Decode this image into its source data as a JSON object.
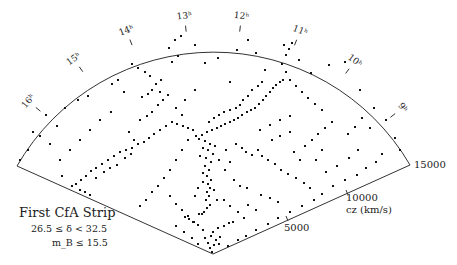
{
  "chart_data": {
    "type": "scatter",
    "projection": "polar wedge (redshift cone diagram)",
    "title": "First CfA Strip",
    "subtitle_lines": [
      "26.5 ≤ δ < 32.5",
      "m_B ≤ 15.5"
    ],
    "radial_axis": {
      "label": "cz (km/s)",
      "ticks": [
        5000,
        10000,
        15000
      ],
      "range": [
        0,
        15000
      ]
    },
    "angular_axis": {
      "label": "right ascension",
      "ticks": [
        "8h",
        "9h",
        "10h",
        "11h",
        "12h",
        "13h",
        "14h",
        "15h",
        "16h",
        "17h"
      ],
      "range_hours": [
        8,
        17
      ]
    },
    "grid": false,
    "legend": null,
    "points_px": [
      [
        212,
        252
      ],
      [
        210,
        248
      ],
      [
        214,
        245
      ],
      [
        208,
        243
      ],
      [
        216,
        240
      ],
      [
        205,
        238
      ],
      [
        220,
        237
      ],
      [
        211,
        236
      ],
      [
        213,
        232
      ],
      [
        203,
        230
      ],
      [
        218,
        228
      ],
      [
        224,
        226
      ],
      [
        229,
        223
      ],
      [
        233,
        222
      ],
      [
        198,
        225
      ],
      [
        193,
        222
      ],
      [
        189,
        219
      ],
      [
        185,
        217
      ],
      [
        199,
        214
      ],
      [
        204,
        212
      ],
      [
        207,
        208
      ],
      [
        210,
        205
      ],
      [
        206,
        200
      ],
      [
        209,
        196
      ],
      [
        207,
        192
      ],
      [
        210,
        188
      ],
      [
        208,
        184
      ],
      [
        211,
        180
      ],
      [
        207,
        176
      ],
      [
        203,
        173
      ],
      [
        209,
        170
      ],
      [
        205,
        166
      ],
      [
        211,
        162
      ],
      [
        206,
        158
      ],
      [
        200,
        156
      ],
      [
        213,
        154
      ],
      [
        208,
        150
      ],
      [
        203,
        148
      ],
      [
        215,
        146
      ],
      [
        210,
        144
      ],
      [
        205,
        141
      ],
      [
        199,
        139
      ],
      [
        196,
        136
      ],
      [
        202,
        135
      ],
      [
        207,
        132
      ],
      [
        212,
        130
      ],
      [
        217,
        128
      ],
      [
        221,
        126
      ],
      [
        225,
        124
      ],
      [
        230,
        122
      ],
      [
        234,
        120
      ],
      [
        238,
        118
      ],
      [
        242,
        115
      ],
      [
        247,
        112
      ],
      [
        251,
        110
      ],
      [
        255,
        108
      ],
      [
        259,
        104
      ],
      [
        263,
        100
      ],
      [
        266,
        96
      ],
      [
        270,
        92
      ],
      [
        273,
        88
      ],
      [
        276,
        85
      ],
      [
        280,
        82
      ],
      [
        283,
        80
      ],
      [
        262,
        82
      ],
      [
        258,
        86
      ],
      [
        252,
        90
      ],
      [
        248,
        96
      ],
      [
        243,
        100
      ],
      [
        240,
        105
      ],
      [
        236,
        108
      ],
      [
        230,
        110
      ],
      [
        224,
        112
      ],
      [
        219,
        115
      ],
      [
        214,
        118
      ],
      [
        209,
        122
      ],
      [
        193,
        130
      ],
      [
        188,
        128
      ],
      [
        183,
        126
      ],
      [
        177,
        124
      ],
      [
        172,
        122
      ],
      [
        166,
        126
      ],
      [
        160,
        130
      ],
      [
        154,
        134
      ],
      [
        149,
        138
      ],
      [
        144,
        142
      ],
      [
        138,
        144
      ],
      [
        132,
        148
      ],
      [
        126,
        150
      ],
      [
        120,
        152
      ],
      [
        114,
        156
      ],
      [
        108,
        160
      ],
      [
        102,
        164
      ],
      [
        96,
        168
      ],
      [
        91,
        171
      ],
      [
        86,
        176
      ],
      [
        81,
        180
      ],
      [
        76,
        184
      ],
      [
        72,
        186
      ],
      [
        80,
        190
      ],
      [
        85,
        192
      ],
      [
        90,
        195
      ],
      [
        96,
        178
      ],
      [
        104,
        172
      ],
      [
        110,
        168
      ],
      [
        117,
        165
      ],
      [
        125,
        158
      ],
      [
        131,
        154
      ],
      [
        134,
        140
      ],
      [
        129,
        132
      ],
      [
        140,
        120
      ],
      [
        147,
        116
      ],
      [
        152,
        112
      ],
      [
        158,
        105
      ],
      [
        163,
        100
      ],
      [
        168,
        95
      ],
      [
        160,
        92
      ],
      [
        152,
        90
      ],
      [
        148,
        94
      ],
      [
        142,
        97
      ],
      [
        156,
        84
      ],
      [
        161,
        80
      ],
      [
        150,
        76
      ],
      [
        145,
        72
      ],
      [
        138,
        68
      ],
      [
        132,
        64
      ],
      [
        118,
        80
      ],
      [
        112,
        84
      ],
      [
        124,
        92
      ],
      [
        111,
        112
      ],
      [
        100,
        120
      ],
      [
        90,
        130
      ],
      [
        80,
        140
      ],
      [
        70,
        150
      ],
      [
        60,
        160
      ],
      [
        62,
        176
      ],
      [
        40,
        136
      ],
      [
        50,
        144
      ],
      [
        57,
        126
      ],
      [
        65,
        108
      ],
      [
        78,
        100
      ],
      [
        88,
        96
      ],
      [
        46,
        115
      ],
      [
        33,
        132
      ],
      [
        28,
        150
      ],
      [
        20,
        160
      ],
      [
        236,
        144
      ],
      [
        242,
        148
      ],
      [
        246,
        152
      ],
      [
        252,
        155
      ],
      [
        258,
        150
      ],
      [
        262,
        156
      ],
      [
        268,
        160
      ],
      [
        275,
        164
      ],
      [
        281,
        170
      ],
      [
        288,
        174
      ],
      [
        296,
        178
      ],
      [
        304,
        183
      ],
      [
        310,
        188
      ],
      [
        300,
        160
      ],
      [
        294,
        152
      ],
      [
        305,
        146
      ],
      [
        312,
        140
      ],
      [
        318,
        134
      ],
      [
        325,
        128
      ],
      [
        332,
        122
      ],
      [
        322,
        110
      ],
      [
        315,
        104
      ],
      [
        308,
        98
      ],
      [
        302,
        92
      ],
      [
        296,
        86
      ],
      [
        290,
        80
      ],
      [
        286,
        72
      ],
      [
        282,
        64
      ],
      [
        286,
        55
      ],
      [
        289,
        49
      ],
      [
        292,
        43
      ],
      [
        284,
        45
      ],
      [
        299,
        60
      ],
      [
        311,
        73
      ],
      [
        329,
        65
      ],
      [
        345,
        62
      ],
      [
        360,
        90
      ],
      [
        374,
        108
      ],
      [
        386,
        120
      ],
      [
        395,
        138
      ],
      [
        400,
        150
      ],
      [
        382,
        154
      ],
      [
        376,
        162
      ],
      [
        366,
        168
      ],
      [
        357,
        175
      ],
      [
        345,
        180
      ],
      [
        333,
        186
      ],
      [
        322,
        194
      ],
      [
        314,
        200
      ],
      [
        302,
        206
      ],
      [
        290,
        212
      ],
      [
        278,
        218
      ],
      [
        268,
        224
      ],
      [
        256,
        230
      ],
      [
        246,
        236
      ],
      [
        238,
        240
      ],
      [
        228,
        246
      ],
      [
        261,
        195
      ],
      [
        270,
        198
      ],
      [
        278,
        202
      ],
      [
        248,
        205
      ],
      [
        256,
        210
      ],
      [
        234,
        180
      ],
      [
        240,
        186
      ],
      [
        247,
        188
      ],
      [
        225,
        170
      ],
      [
        230,
        162
      ],
      [
        219,
        160
      ],
      [
        226,
        150
      ],
      [
        260,
        130
      ],
      [
        270,
        125
      ],
      [
        280,
        120
      ],
      [
        290,
        116
      ],
      [
        272,
        140
      ],
      [
        280,
        136
      ],
      [
        290,
        132
      ],
      [
        348,
        134
      ],
      [
        355,
        127
      ],
      [
        362,
        118
      ],
      [
        370,
        128
      ],
      [
        358,
        150
      ],
      [
        349,
        158
      ],
      [
        337,
        166
      ],
      [
        326,
        172
      ],
      [
        316,
        160
      ],
      [
        322,
        150
      ],
      [
        172,
        62
      ],
      [
        178,
        56
      ],
      [
        169,
        48
      ],
      [
        175,
        40
      ],
      [
        181,
        36
      ],
      [
        195,
        45
      ],
      [
        205,
        63
      ],
      [
        218,
        58
      ],
      [
        237,
        50
      ],
      [
        248,
        40
      ],
      [
        256,
        53
      ],
      [
        265,
        70
      ],
      [
        230,
        82
      ],
      [
        195,
        90
      ],
      [
        185,
        100
      ],
      [
        176,
        108
      ],
      [
        182,
        115
      ],
      [
        188,
        140
      ],
      [
        182,
        150
      ],
      [
        176,
        160
      ],
      [
        170,
        170
      ],
      [
        164,
        178
      ],
      [
        158,
        186
      ],
      [
        152,
        192
      ],
      [
        146,
        200
      ],
      [
        140,
        206
      ],
      [
        170,
        196
      ],
      [
        176,
        204
      ],
      [
        182,
        210
      ],
      [
        188,
        216
      ],
      [
        194,
        222
      ],
      [
        224,
        200
      ],
      [
        230,
        206
      ],
      [
        238,
        212
      ],
      [
        244,
        218
      ],
      [
        176,
        226
      ],
      [
        184,
        232
      ],
      [
        192,
        238
      ],
      [
        198,
        244
      ],
      [
        219,
        244
      ],
      [
        203,
        182
      ],
      [
        198,
        188
      ],
      [
        195,
        196
      ],
      [
        214,
        190
      ],
      [
        217,
        200
      ],
      [
        202,
        214
      ]
    ]
  }
}
